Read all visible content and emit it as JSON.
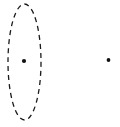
{
  "figure": {
    "canvas": {
      "width": 120,
      "height": 127,
      "background_color": "#ffffff"
    },
    "stroke_color": "#1a1a1a",
    "point_color": "#111111",
    "shapes": {
      "ellipse": {
        "name": "dashed-ellipse",
        "center_x": 24.5,
        "center_y": 62,
        "radius_x": 16.5,
        "radius_y": 58,
        "stroke_width": 1.3,
        "dash_pattern": "5 4",
        "fill": "none"
      },
      "points": [
        {
          "name": "center-point",
          "label": "",
          "cx": 24,
          "cy": 61,
          "r": 2.1
        },
        {
          "name": "outer-point",
          "label": "",
          "cx": 108.5,
          "cy": 60,
          "r": 1.9
        }
      ]
    }
  }
}
